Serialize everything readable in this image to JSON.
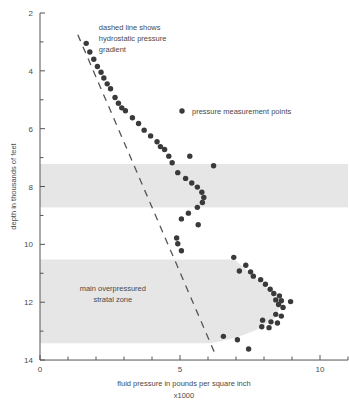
{
  "chart_data": {
    "type": "scatter",
    "title": "",
    "xlabel": "fluid pressure in pounds per square inch",
    "xlabel_sub": "x1000",
    "ylabel": "depth in thousands of feet",
    "xlim": [
      0,
      11
    ],
    "ylim": [
      2,
      14
    ],
    "y_inverted": true,
    "grid": false,
    "x_ticks_major": [
      0,
      5,
      10
    ],
    "x_tick_labels": [
      "0",
      "5",
      "10"
    ],
    "x_ticks_minor": [
      1,
      2,
      3,
      4,
      6,
      7,
      8,
      9,
      11
    ],
    "y_ticks_major": [
      2,
      4,
      6,
      8,
      10,
      12,
      14
    ],
    "y_tick_labels": [
      "2",
      "4",
      "6",
      "8",
      "10",
      "12",
      "14"
    ],
    "y_ticks_minor": [
      3,
      5,
      7,
      9,
      11,
      13
    ],
    "legend": {
      "position": "upper-right-inside",
      "entries": [
        {
          "label": "pressure measurement points",
          "marker": "circle",
          "color": "#3a3a3a"
        }
      ]
    },
    "annotations": [
      {
        "name": "hydrostatic-note",
        "lines": [
          "dashed line shows",
          "hydrostatic pressure",
          "gradient"
        ],
        "x": 2.1,
        "y": 2.6
      },
      {
        "name": "overpressured-zone-note",
        "lines": [
          "main overpressured",
          "stratal zone"
        ],
        "x": 2.6,
        "y": 11.6
      }
    ],
    "series": [
      {
        "name": "pressure measurement points",
        "marker": "circle",
        "color": "#3a3a3a",
        "points": [
          [
            1.65,
            3.05
          ],
          [
            1.78,
            3.35
          ],
          [
            1.92,
            3.6
          ],
          [
            2.05,
            3.85
          ],
          [
            2.18,
            4.05
          ],
          [
            2.28,
            4.25
          ],
          [
            2.4,
            4.45
          ],
          [
            2.52,
            4.62
          ],
          [
            2.68,
            4.92
          ],
          [
            2.8,
            5.12
          ],
          [
            2.92,
            5.28
          ],
          [
            3.05,
            5.38
          ],
          [
            3.3,
            5.62
          ],
          [
            3.52,
            5.82
          ],
          [
            3.72,
            6.05
          ],
          [
            3.95,
            6.25
          ],
          [
            4.18,
            6.45
          ],
          [
            4.3,
            6.62
          ],
          [
            4.45,
            6.72
          ],
          [
            4.6,
            6.95
          ],
          [
            5.35,
            6.95
          ],
          [
            4.72,
            7.18
          ],
          [
            6.2,
            7.28
          ],
          [
            4.92,
            7.52
          ],
          [
            5.2,
            7.72
          ],
          [
            5.42,
            7.88
          ],
          [
            5.62,
            8.02
          ],
          [
            5.78,
            8.2
          ],
          [
            5.85,
            8.38
          ],
          [
            5.8,
            8.55
          ],
          [
            5.62,
            8.72
          ],
          [
            5.3,
            8.92
          ],
          [
            5.05,
            9.12
          ],
          [
            5.65,
            9.32
          ],
          [
            4.88,
            9.78
          ],
          [
            4.92,
            9.98
          ],
          [
            5.05,
            10.22
          ],
          [
            6.92,
            10.45
          ],
          [
            7.35,
            10.72
          ],
          [
            7.12,
            10.92
          ],
          [
            7.52,
            10.95
          ],
          [
            7.62,
            11.1
          ],
          [
            7.88,
            11.22
          ],
          [
            8.05,
            11.38
          ],
          [
            8.22,
            11.55
          ],
          [
            8.35,
            11.7
          ],
          [
            8.55,
            11.78
          ],
          [
            8.42,
            11.92
          ],
          [
            8.62,
            11.95
          ],
          [
            8.95,
            11.98
          ],
          [
            8.52,
            12.08
          ],
          [
            8.68,
            12.18
          ],
          [
            8.42,
            12.42
          ],
          [
            8.62,
            12.48
          ],
          [
            7.95,
            12.62
          ],
          [
            8.25,
            12.68
          ],
          [
            8.48,
            12.72
          ],
          [
            7.92,
            12.85
          ],
          [
            8.18,
            12.88
          ],
          [
            6.55,
            13.18
          ],
          [
            7.05,
            13.3
          ],
          [
            7.45,
            13.62
          ]
        ]
      }
    ],
    "hydrostatic_line": {
      "name": "hydrostatic pressure gradient",
      "style": "dashed",
      "color": "#555555",
      "x_start": 1.35,
      "y_start": 2.75,
      "x_end": 6.28,
      "y_end": 13.85
    },
    "shaded_zones": [
      {
        "name": "upper-shaded-band",
        "color": "#e6e6e6",
        "y_top": 7.22,
        "y_bottom": 8.72,
        "x_left": 0,
        "x_right": 11,
        "shape": "band"
      },
      {
        "name": "main-overpressured-stratal-zone",
        "color": "#e6e6e6",
        "y_top": 10.52,
        "y_bottom": 13.42,
        "x_left": 0,
        "shape": "bulge",
        "bulge_points": [
          [
            0,
            10.52
          ],
          [
            6.95,
            10.52
          ],
          [
            7.55,
            11.05
          ],
          [
            8.15,
            11.55
          ],
          [
            8.6,
            12.05
          ],
          [
            8.4,
            12.55
          ],
          [
            7.75,
            12.95
          ],
          [
            6.95,
            13.25
          ],
          [
            6.1,
            13.42
          ],
          [
            0,
            13.42
          ]
        ]
      }
    ]
  }
}
